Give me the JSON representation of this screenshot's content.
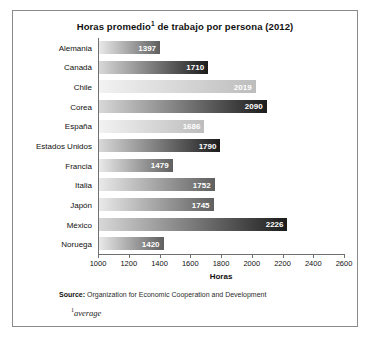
{
  "chart_data": {
    "type": "bar",
    "orientation": "horizontal",
    "title_main": "Horas promedio",
    "title_sup": "1",
    "title_rest": " de trabajo por persona (2012)",
    "xlabel": "Horas",
    "ylabel": "",
    "xlim": [
      1000,
      2600
    ],
    "xticks": [
      1000,
      1200,
      1400,
      1600,
      1800,
      2000,
      2200,
      2400,
      2600
    ],
    "grid": false,
    "legend": "none",
    "categories": [
      "Alemania",
      "Canadá",
      "Chile",
      "Corea",
      "España",
      "Estados Unidos",
      "Francia",
      "Italia",
      "Japón",
      "México",
      "Noruega"
    ],
    "values": [
      1397,
      1710,
      2019,
      2090,
      1686,
      1790,
      1479,
      1752,
      1745,
      2226,
      1420
    ],
    "bar_shades": [
      "mid",
      "dark",
      "light",
      "dark",
      "light",
      "dark",
      "mid",
      "mid",
      "mid",
      "dark",
      "mid"
    ]
  },
  "source": {
    "label": "Source:",
    "text": " Organization for Economic Cooperation and Development"
  },
  "footnote": {
    "marker": "1",
    "text": "average"
  },
  "colors": {
    "frame": "#8a8a8a",
    "axis": "#6f6f6f",
    "text": "#111111",
    "value_text": "#ffffff",
    "bar_gradient_start": "#e9e9e9",
    "bar_gradient_end": "#5f5f5f"
  }
}
